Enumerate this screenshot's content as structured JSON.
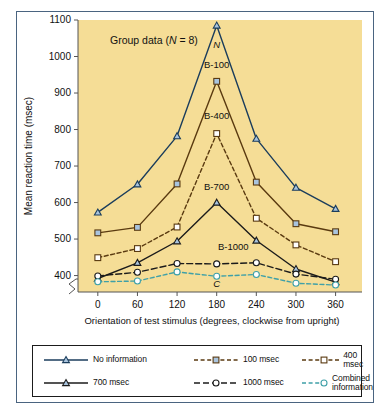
{
  "figure": {
    "annotation": "Group data (N = 8)",
    "annotation_italic_part": "N",
    "background_color": "#f5dd96",
    "frame_color": "#4a6480"
  },
  "chart_data": {
    "type": "line",
    "title": "",
    "xlabel": "Orientation of test stimulus (degrees, clockwise from upright)",
    "ylabel": "Mean reaction time (msec)",
    "x": [
      0,
      60,
      120,
      180,
      240,
      300,
      360
    ],
    "xticks": [
      0,
      60,
      120,
      180,
      240,
      300,
      360
    ],
    "yticks": [
      400,
      500,
      600,
      700,
      800,
      900,
      1000,
      1100
    ],
    "xlim": [
      -30,
      400
    ],
    "ylim": [
      355,
      1100
    ],
    "grid": false,
    "axis_break": true,
    "legend_position": "below-axes",
    "series": [
      {
        "name": "No information",
        "curve_label": "N",
        "values": [
          573,
          650,
          782,
          1085,
          775,
          641,
          583
        ],
        "color": "#1b3d5c",
        "marker": "triangle",
        "dash": "none",
        "label_x": 180,
        "label_y": 1022
      },
      {
        "name": "100 msec",
        "curve_label": "B-100",
        "values": [
          517,
          532,
          651,
          932,
          656,
          542,
          520
        ],
        "color": "#5a3a10",
        "marker": "square",
        "dash": "none",
        "label_x": 180,
        "label_y": 968
      },
      {
        "name": "400 msec",
        "curve_label": "B-400",
        "values": [
          449,
          474,
          533,
          789,
          557,
          484,
          438
        ],
        "color": "#5a3a10",
        "marker": "square-open",
        "dash": "dashed",
        "label_x": 180,
        "label_y": 828
      },
      {
        "name": "700 msec",
        "curve_label": "B-700",
        "values": [
          392,
          435,
          494,
          600,
          496,
          418,
          382
        ],
        "color": "#1b1b1b",
        "marker": "triangle",
        "dash": "none",
        "label_x": 180,
        "label_y": 634
      },
      {
        "name": "1000 msec",
        "curve_label": "B-1000",
        "values": [
          399,
          409,
          433,
          432,
          435,
          404,
          390
        ],
        "color": "#1b1b1b",
        "marker": "circle",
        "dash": "longdash",
        "label_x": 205,
        "label_y": 470
      },
      {
        "name": "Combined\ninformation",
        "curve_label": "C",
        "values": [
          383,
          385,
          410,
          398,
          403,
          379,
          374
        ],
        "color": "#3fa0a8",
        "marker": "circle",
        "dash": "dashed",
        "label_x": 180,
        "label_y": 369
      }
    ]
  },
  "legend": {
    "items": [
      {
        "label": "No information",
        "color": "#1b3d5c",
        "marker": "triangle",
        "dash": "none"
      },
      {
        "label": "100 msec",
        "color": "#5a3a10",
        "marker": "square",
        "dash": "dashed"
      },
      {
        "label": "400 msec",
        "color": "#5a3a10",
        "marker": "square-open",
        "dash": "dashed"
      },
      {
        "label": "700 msec",
        "color": "#1b1b1b",
        "marker": "triangle",
        "dash": "none"
      },
      {
        "label": "1000 msec",
        "color": "#1b1b1b",
        "marker": "circle",
        "dash": "longdash"
      },
      {
        "label": "Combined\ninformation",
        "color": "#3fa0a8",
        "marker": "circle",
        "dash": "dashed"
      }
    ]
  }
}
